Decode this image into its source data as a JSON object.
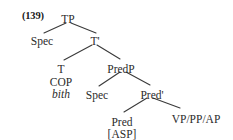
{
  "figure": {
    "example_number": "(139)",
    "kind": "syntax-tree",
    "background_color": "#ffffff",
    "text_color": "#2b2b2b",
    "line_color": "#3a3a3a"
  },
  "tree": {
    "nodes": [
      {
        "id": "tp",
        "label": "TP",
        "x": 68,
        "y": 14
      },
      {
        "id": "spec-tp",
        "label": "Spec",
        "x": 42,
        "y": 36
      },
      {
        "id": "tbar",
        "label": "T'",
        "x": 95,
        "y": 36
      },
      {
        "id": "t",
        "label": "T",
        "x": 61,
        "y": 64
      },
      {
        "id": "predp",
        "label": "PredP",
        "x": 121,
        "y": 64
      },
      {
        "id": "spec-pred",
        "label": "Spec",
        "x": 97,
        "y": 90
      },
      {
        "id": "predbar",
        "label": "Pred'",
        "x": 152,
        "y": 90
      },
      {
        "id": "pred",
        "label": "Pred",
        "x": 122,
        "y": 117
      },
      {
        "id": "complement",
        "label": "VP/PP/AP",
        "x": 196,
        "y": 114
      }
    ],
    "terminals": [
      {
        "id": "t-cop",
        "label": "COP",
        "x": 61,
        "y": 77,
        "style": "roman"
      },
      {
        "id": "t-bith",
        "label": "bith",
        "x": 61,
        "y": 89,
        "style": "italic"
      },
      {
        "id": "pred-asp",
        "label": "[ASP]",
        "x": 122,
        "y": 129,
        "style": "roman"
      }
    ],
    "branches": [
      {
        "id": "tp-to-spec",
        "x1": 66,
        "y1": 23,
        "x2": 44,
        "y2": 33
      },
      {
        "id": "tp-to-tbar",
        "x1": 71,
        "y1": 23,
        "x2": 96,
        "y2": 33
      },
      {
        "id": "tbar-to-t",
        "x1": 92,
        "y1": 45,
        "x2": 64,
        "y2": 60
      },
      {
        "id": "tbar-to-predp",
        "x1": 97,
        "y1": 45,
        "x2": 120,
        "y2": 59
      },
      {
        "id": "predp-to-spec",
        "x1": 120,
        "y1": 72,
        "x2": 99,
        "y2": 86
      },
      {
        "id": "predp-to-predbar",
        "x1": 126,
        "y1": 72,
        "x2": 150,
        "y2": 85
      },
      {
        "id": "predbar-to-pred",
        "x1": 147,
        "y1": 98,
        "x2": 124,
        "y2": 112
      },
      {
        "id": "predbar-to-comp",
        "x1": 153,
        "y1": 98,
        "x2": 180,
        "y2": 108
      }
    ]
  }
}
